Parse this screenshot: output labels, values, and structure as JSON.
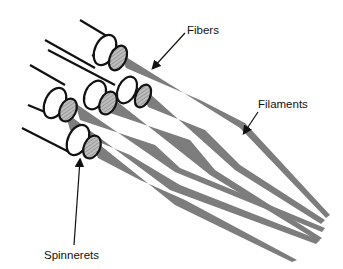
{
  "diagram": {
    "labels": {
      "fibers": "Fibers",
      "filaments": "Filaments",
      "spinnerets": "Spinnerets"
    },
    "colors": {
      "line": "#111111",
      "fiber_fill": "#7a7a7a",
      "background": "#ffffff"
    }
  }
}
